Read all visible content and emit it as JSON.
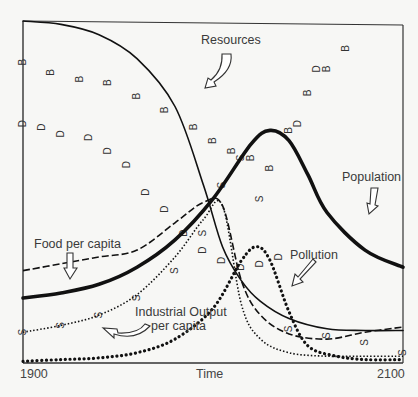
{
  "chart_data": {
    "type": "line",
    "title": "",
    "xlabel": "Time",
    "ylabel": "",
    "x_tick_labels": [
      "1900",
      "2100"
    ],
    "xlim": [
      1900,
      2100
    ],
    "ylim": [
      0,
      100
    ],
    "grid": false,
    "legend": "inline labels with arrows",
    "series": [
      {
        "name": "Resources",
        "style": "solid thin",
        "x": [
          1900,
          1920,
          1940,
          1960,
          1980,
          1995,
          2005,
          2015,
          2025,
          2040,
          2060,
          2080,
          2100
        ],
        "y": [
          100,
          99,
          96,
          89,
          75,
          52,
          34,
          24,
          18,
          13,
          10,
          9.5,
          9.5
        ]
      },
      {
        "name": "Population",
        "style": "solid thick",
        "x": [
          1900,
          1920,
          1940,
          1960,
          1980,
          2000,
          2020,
          2030,
          2040,
          2050,
          2060,
          2080,
          2100
        ],
        "y": [
          19,
          20.5,
          23,
          28,
          36,
          48,
          64,
          68,
          65,
          55,
          44,
          33,
          28
        ]
      },
      {
        "name": "Food per capita",
        "style": "dashed",
        "x": [
          1900,
          1920,
          1940,
          1960,
          1980,
          1995,
          2005,
          2015,
          2025,
          2040,
          2060,
          2080,
          2100
        ],
        "y": [
          27,
          29,
          31,
          33,
          41,
          47,
          46,
          24,
          14,
          8.5,
          7,
          9,
          10.5
        ]
      },
      {
        "name": "Industrial Output per capita",
        "style": "dotted fine",
        "x": [
          1900,
          1920,
          1940,
          1960,
          1980,
          1995,
          2005,
          2015,
          2025,
          2040,
          2060,
          2080,
          2100
        ],
        "y": [
          9,
          11,
          14,
          20,
          31,
          42,
          46,
          17,
          7,
          3,
          2,
          2,
          2
        ]
      },
      {
        "name": "Pollution",
        "style": "dotted heavy",
        "x": [
          1900,
          1920,
          1940,
          1960,
          1980,
          2000,
          2015,
          2023,
          2030,
          2040,
          2050,
          2065,
          2080,
          2100
        ],
        "y": [
          0.5,
          1,
          1.5,
          3,
          7,
          16,
          30,
          34,
          30,
          15,
          5,
          2,
          1,
          1
        ]
      },
      {
        "name": "Birth rate (B)",
        "style": "marker B",
        "x": [
          1900,
          1915,
          1930,
          1945,
          1960,
          1975,
          1990,
          2000,
          2010,
          2020,
          2030,
          2040,
          2050,
          2060,
          2070
        ],
        "y": [
          88,
          85,
          83,
          82,
          78,
          74,
          69,
          65,
          62,
          60,
          57,
          68,
          79,
          86,
          92
        ]
      },
      {
        "name": "Death rate (D)",
        "style": "marker D",
        "x": [
          1900,
          1910,
          1920,
          1935,
          1945,
          1955,
          1965,
          1975,
          1985,
          1995,
          2005,
          2015,
          2025,
          2035,
          2045,
          2055
        ],
        "y": [
          70,
          69,
          67,
          66,
          62,
          58,
          50,
          45,
          38,
          33,
          30,
          28,
          29,
          31,
          70,
          86
        ]
      },
      {
        "name": "Services per capita (S)",
        "style": "marker S",
        "x": [
          1900,
          1920,
          1940,
          1960,
          1980,
          1995,
          2005,
          2015,
          2025,
          2040,
          2060,
          2080,
          2100
        ],
        "y": [
          9,
          11,
          14,
          19,
          27,
          38,
          52,
          60,
          48,
          10,
          8,
          6,
          3
        ]
      }
    ]
  },
  "labels": {
    "resources": "Resources",
    "population": "Population",
    "food": "Food per capita",
    "pollution": "Pollution",
    "industrial_line1": "Industrial Output",
    "industrial_line2": "per capita",
    "x_start": "1900",
    "x_end": "2100",
    "x_axis": "Time"
  },
  "plot_px": {
    "left": 23,
    "top": 21,
    "right": 403,
    "bottom": 363
  }
}
